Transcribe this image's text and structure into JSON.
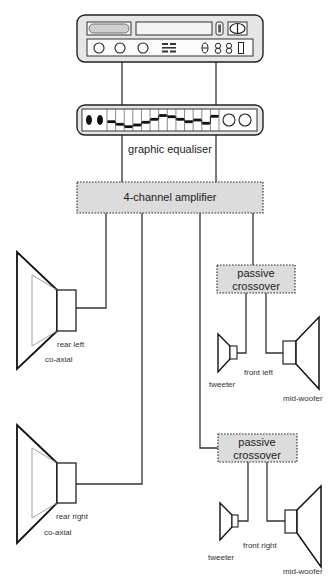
{
  "diagram": {
    "head_unit": {
      "name": "head unit",
      "display_digits": [
        "8",
        "8",
        "8"
      ]
    },
    "equaliser": {
      "label": "graphic equaliser",
      "band_count": 13,
      "band_slider_y": [
        121.7,
        124.3,
        126.7,
        125,
        122.3,
        119.3,
        115.5,
        116.7,
        119.3,
        121.7,
        120,
        123.3,
        116.3
      ]
    },
    "amplifier": {
      "label": "4-channel amplifier"
    },
    "crossover_front_left": {
      "line1": "passive",
      "line2": "crossover"
    },
    "crossover_front_right": {
      "line1": "passive",
      "line2": "crossover"
    },
    "speakers": {
      "rear_left": {
        "position": "rear left",
        "type": "co-axial"
      },
      "rear_right": {
        "position": "rear right",
        "type": "co-axial"
      },
      "front_left": {
        "position": "front left",
        "tweeter": "tweeter",
        "woofer": "mid-woofer"
      },
      "front_right": {
        "position": "front right",
        "tweeter": "tweeter",
        "woofer": "mid-woofer"
      }
    },
    "colors": {
      "line": "#333333",
      "box_fill": "#dcdcdc",
      "device_fill": "#e6e6e6",
      "background": "#ffffff"
    }
  }
}
